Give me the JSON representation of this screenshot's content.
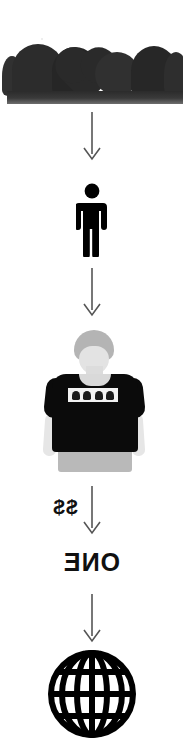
{
  "diagram": {
    "orientation": "vertical",
    "background_color": "#ffffff",
    "accent_color": "#101010",
    "arrow_color": "#555555"
  },
  "steps": [
    {
      "id": "step-cookies",
      "kind": "photo",
      "icon_name": "cookies-tray-photo",
      "caption": "",
      "description": "dark round and heart shaped cookies on a dark tray"
    },
    {
      "id": "step-person",
      "kind": "pictogram",
      "icon_name": "person-icon",
      "caption": "",
      "description": "solid black standing person pictogram"
    },
    {
      "id": "step-tshirt",
      "kind": "photo",
      "icon_name": "printed-tshirt-photo",
      "caption": "",
      "description": "person wearing a black t-shirt with a white printed graphic band"
    },
    {
      "id": "step-globe",
      "kind": "pictogram",
      "icon_name": "globe-icon",
      "caption": "",
      "description": "black wireframe globe with meridians and parallels"
    }
  ],
  "arrows": [
    {
      "id": "arrow-1",
      "icon_name": "arrow-down-icon",
      "label": ""
    },
    {
      "id": "arrow-2",
      "icon_name": "arrow-down-icon",
      "label": ""
    },
    {
      "id": "arrow-3",
      "icon_name": "arrow-down-icon",
      "label": "$$"
    },
    {
      "id": "arrow-4",
      "icon_name": "arrow-down-icon",
      "label": ""
    }
  ],
  "labels": {
    "price": "$$",
    "quantity": "ONE",
    "price_mirrored": true,
    "quantity_mirrored": true
  }
}
